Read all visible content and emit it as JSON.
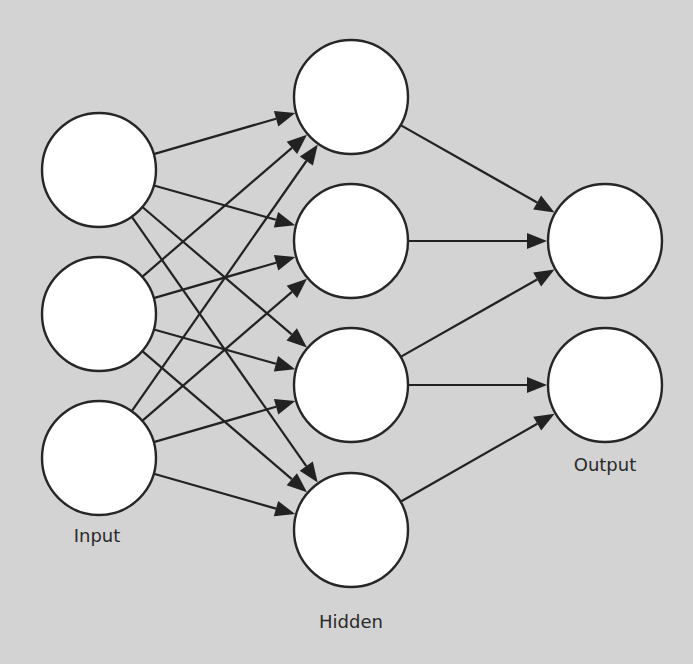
{
  "diagram": {
    "type": "neural-network",
    "colors": {
      "background": "#d3d3d3",
      "node_fill": "#ffffff",
      "node_stroke": "#262626",
      "edge": "#222222",
      "label": "#2a2a2a"
    },
    "node_radius": 57,
    "layers": [
      {
        "id": "input",
        "label": "Input",
        "label_pos": {
          "x": 97,
          "y": 526
        },
        "nodes": [
          {
            "id": "I1",
            "x": 99,
            "y": 170
          },
          {
            "id": "I2",
            "x": 99,
            "y": 314
          },
          {
            "id": "I3",
            "x": 99,
            "y": 458
          }
        ]
      },
      {
        "id": "hidden",
        "label": "Hidden",
        "label_pos": {
          "x": 351,
          "y": 612
        },
        "nodes": [
          {
            "id": "H1",
            "x": 351,
            "y": 97
          },
          {
            "id": "H2",
            "x": 351,
            "y": 241
          },
          {
            "id": "H3",
            "x": 351,
            "y": 385
          },
          {
            "id": "H4",
            "x": 351,
            "y": 530
          }
        ]
      },
      {
        "id": "output",
        "label": "Output",
        "label_pos": {
          "x": 605,
          "y": 455
        },
        "nodes": [
          {
            "id": "O1",
            "x": 605,
            "y": 241
          },
          {
            "id": "O2",
            "x": 605,
            "y": 385
          }
        ]
      }
    ],
    "edges": [
      [
        "I1",
        "H1"
      ],
      [
        "I1",
        "H2"
      ],
      [
        "I1",
        "H3"
      ],
      [
        "I1",
        "H4"
      ],
      [
        "I2",
        "H1"
      ],
      [
        "I2",
        "H2"
      ],
      [
        "I2",
        "H3"
      ],
      [
        "I2",
        "H4"
      ],
      [
        "I3",
        "H1"
      ],
      [
        "I3",
        "H2"
      ],
      [
        "I3",
        "H3"
      ],
      [
        "I3",
        "H4"
      ],
      [
        "H1",
        "O1"
      ],
      [
        "H2",
        "O1"
      ],
      [
        "H3",
        "O1"
      ],
      [
        "H3",
        "O2"
      ],
      [
        "H4",
        "O2"
      ]
    ]
  }
}
